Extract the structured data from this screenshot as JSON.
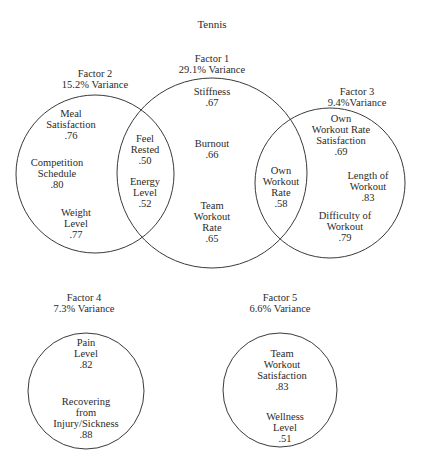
{
  "title": "Tennis",
  "factors": [
    {
      "name": "Factor 1",
      "variance": "29.1% Variance"
    },
    {
      "name": "Factor 2",
      "variance": "15.2% Variance"
    },
    {
      "name": "Factor 3",
      "variance": "9.4%Variance"
    },
    {
      "name": "Factor 4",
      "variance": "7.3% Variance"
    },
    {
      "name": "Factor 5",
      "variance": "6.6% Variance"
    }
  ],
  "items": {
    "meal_satisfaction": {
      "lines": [
        "Meal",
        "Satisfaction"
      ],
      "value": ".76"
    },
    "competition_schedule": {
      "lines": [
        "Competition",
        "Schedule"
      ],
      "value": ".80"
    },
    "weight_level": {
      "lines": [
        "Weight",
        "Level"
      ],
      "value": ".77"
    },
    "feel_rested": {
      "lines": [
        "Feel",
        "Rested"
      ],
      "value": ".50"
    },
    "energy_level": {
      "lines": [
        "Energy",
        "Level"
      ],
      "value": ".52"
    },
    "stiffness": {
      "lines": [
        "Stiffness"
      ],
      "value": ".67"
    },
    "burnout": {
      "lines": [
        "Burnout"
      ],
      "value": ".66"
    },
    "team_workout_rate": {
      "lines": [
        "Team",
        "Workout",
        "Rate"
      ],
      "value": ".65"
    },
    "own_workout_rate": {
      "lines": [
        "Own",
        "Workout",
        "Rate"
      ],
      "value": ".58"
    },
    "own_workout_rate_satisfaction": {
      "lines": [
        "Own",
        "Workout Rate",
        "Satisfaction"
      ],
      "value": ".69"
    },
    "length_of_workout": {
      "lines": [
        "Length of",
        "Workout"
      ],
      "value": ".83"
    },
    "difficulty_of_workout": {
      "lines": [
        "Difficulty of",
        "Workout"
      ],
      "value": ".79"
    },
    "pain_level": {
      "lines": [
        "Pain",
        "Level"
      ],
      "value": ".82"
    },
    "recovering": {
      "lines": [
        "Recovering",
        "from",
        "Injury/Sickness"
      ],
      "value": ".88"
    },
    "team_workout_satisfaction": {
      "lines": [
        "Team",
        "Workout",
        "Satisfaction"
      ],
      "value": ".83"
    },
    "wellness_level": {
      "lines": [
        "Wellness",
        "Level"
      ],
      "value": ".51"
    }
  },
  "colors": {
    "stroke": "#3a3a3a",
    "text": "#2a2a2a",
    "background": "#ffffff"
  }
}
